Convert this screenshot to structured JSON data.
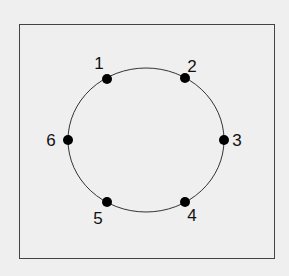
{
  "diagram": {
    "type": "ring-of-nodes",
    "frame": {
      "x": 19,
      "y": 24,
      "w": 255,
      "h": 234
    },
    "circle": {
      "cx": 146,
      "cy": 140,
      "rx": 78,
      "ry": 72
    },
    "nodes": [
      {
        "id": "1",
        "label": "1",
        "x": 107,
        "y": 79,
        "lx": 99,
        "ly": 69
      },
      {
        "id": "2",
        "label": "2",
        "x": 185,
        "y": 78,
        "lx": 192,
        "ly": 72
      },
      {
        "id": "3",
        "label": "3",
        "x": 224,
        "y": 140,
        "lx": 237,
        "ly": 146
      },
      {
        "id": "4",
        "label": "4",
        "x": 185,
        "y": 202,
        "lx": 192,
        "ly": 221
      },
      {
        "id": "5",
        "label": "5",
        "x": 107,
        "y": 202,
        "lx": 98,
        "ly": 224
      },
      {
        "id": "6",
        "label": "6",
        "x": 68,
        "y": 140,
        "lx": 51,
        "ly": 146
      }
    ],
    "colors": {
      "background": "#efefef",
      "stroke": "#222222",
      "node": "#000000"
    }
  }
}
